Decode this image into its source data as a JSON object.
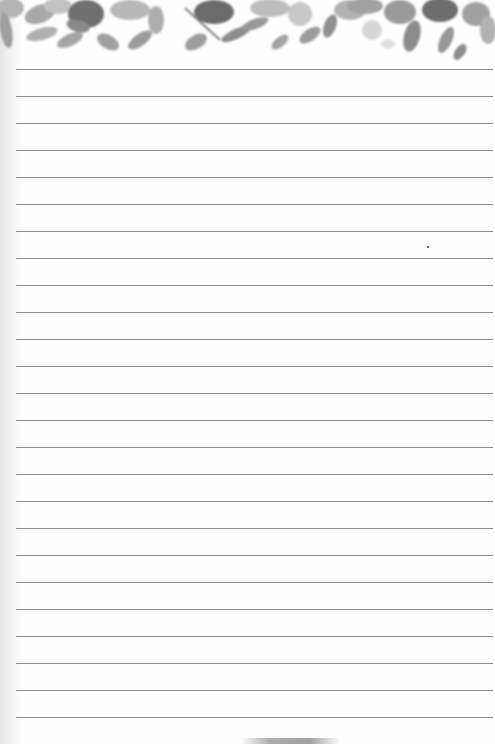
{
  "document": {
    "type": "lined notepaper",
    "header_decoration": "watercolor floral leaf border",
    "line_count": 25,
    "first_line_y": 69,
    "line_spacing": 27,
    "line_left": 16,
    "line_right": 493,
    "colors": {
      "paper": "#fefefe",
      "rule": "#7a7a7a",
      "foliage_dark": "#6e6e6e",
      "foliage_mid": "#9a9a9a",
      "foliage_light": "#c4c4c4"
    }
  }
}
